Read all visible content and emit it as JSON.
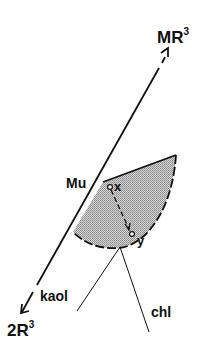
{
  "diagram": {
    "labels": {
      "top_end": "MR",
      "top_end_sup": "3",
      "bottom_end": "2R",
      "bottom_end_sup": "3",
      "mu": "Mu",
      "point_x": "x",
      "point_y": "y",
      "kaol": "kaol",
      "chl": "chl"
    },
    "colors": {
      "line": "#111111",
      "shade": "#b8b8b8",
      "background": "#ffffff"
    },
    "points": {
      "mr3_arrow_tip": [
        168,
        50
      ],
      "axis_upper_solid_start": [
        159,
        68
      ],
      "mu": [
        103,
        182
      ],
      "axis_lower_solid_end": [
        37,
        285
      ],
      "r3_arrow_tip": [
        22,
        312
      ],
      "shade_top_right": [
        176,
        155
      ],
      "shade_bottom_left": [
        73,
        232
      ],
      "tie_origin": [
        120,
        247
      ],
      "kaol_tie_end": [
        77,
        311
      ],
      "chl_tie_end": [
        149,
        332
      ],
      "x": [
        110,
        187
      ],
      "y": [
        132,
        234
      ]
    }
  }
}
